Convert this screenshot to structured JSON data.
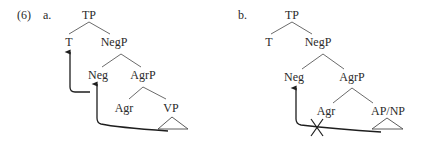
{
  "example": {
    "number": "(6)",
    "panels": [
      {
        "label": "a.",
        "nodes": {
          "root": "TP",
          "t": "T",
          "negp": "NegP",
          "neg": "Neg",
          "agrp": "AgrP",
          "agr": "Agr",
          "complement": "VP"
        },
        "movements": [
          {
            "from": "Neg",
            "to": "T",
            "blocked": false
          },
          {
            "from": "VP",
            "to": "Neg",
            "blocked": false
          }
        ]
      },
      {
        "label": "b.",
        "nodes": {
          "root": "TP",
          "t": "T",
          "negp": "NegP",
          "neg": "Neg",
          "agrp": "AgrP",
          "agr": "Agr",
          "complement": "AP/NP"
        },
        "movements": [
          {
            "from": "AP/NP",
            "to": "Neg",
            "blocked": true,
            "block_mark": "X"
          }
        ]
      }
    ]
  },
  "colors": {
    "text": "#2a2a2a",
    "branch": "#5a5a5a",
    "arrow": "#1e1e1e",
    "background": "#ffffff"
  }
}
